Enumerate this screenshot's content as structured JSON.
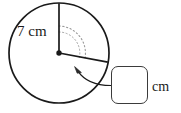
{
  "figure": {
    "type": "circle-sector-angle-diagram",
    "radius_label": "7 cm",
    "unit_label": "cm",
    "circle": {
      "center_x": 59,
      "center_y": 53,
      "radius": 50,
      "stroke": "#1a1a1a"
    },
    "center_dot": {
      "radius": 2.6,
      "color": "#1a1a1a"
    },
    "radii": [
      {
        "name": "vertical-radius",
        "from_x": 59,
        "from_y": 53,
        "to_x": 59,
        "to_y": 3,
        "stroke": "#1a1a1a"
      },
      {
        "name": "slanted-radius",
        "from_x": 59,
        "from_y": 53,
        "to_x": 107,
        "to_y": 62,
        "stroke": "#1a1a1a"
      }
    ],
    "dotted_arcs": [
      {
        "name": "angle-sweep-arc",
        "radius": 27,
        "stroke": "#8a8a8a",
        "dash": "1.2 2.4"
      },
      {
        "name": "inner-angle-arc",
        "radius": 21,
        "stroke": "#8a8a8a",
        "dash": "1.2 2.4"
      }
    ],
    "arrow": {
      "name": "angle-pointer-arrow",
      "tip_x": 75,
      "tip_y": 69,
      "stroke": "#1a1a1a"
    },
    "leader_line": {
      "name": "callout-leader",
      "from_x": 111,
      "from_y": 85,
      "to_x": 77,
      "to_y": 71,
      "stroke": "#1a1a1a"
    }
  },
  "answer": {
    "value": "",
    "placeholder": ""
  }
}
